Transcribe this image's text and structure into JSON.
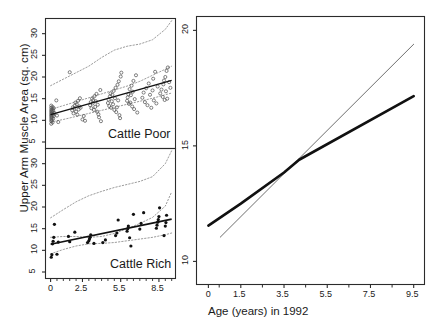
{
  "figure": {
    "ylabel": "Upper Arm Muscle Area (sq. cm)",
    "xlabel_right": "Age (years) in 1992"
  },
  "panels": {
    "top_left": {
      "tag": "Cattle Poor",
      "yticks": [
        "5",
        "10",
        "15",
        "20",
        "25",
        "30"
      ],
      "ytick_values": [
        5,
        10,
        15,
        20,
        25,
        30
      ],
      "xticks": [
        "0",
        "2.5",
        "5.5",
        "8.5"
      ],
      "xtick_values": [
        0,
        2.5,
        5.5,
        8.5
      ]
    },
    "bottom_left": {
      "tag": "Cattle Rich",
      "yticks": [
        "5",
        "10",
        "15",
        "20",
        "25",
        "30"
      ],
      "ytick_values": [
        5,
        10,
        15,
        20,
        25,
        30
      ],
      "xticks": [
        "0",
        "2.5",
        "5.5",
        "8.5"
      ],
      "xtick_values": [
        0,
        2.5,
        5.5,
        8.5
      ]
    },
    "right": {
      "yticks": [
        "10",
        "15",
        "20"
      ],
      "ytick_values": [
        10,
        15,
        20
      ],
      "xticks": [
        "0",
        "1.5",
        "3.5",
        "5.5",
        "7.5",
        "9.5"
      ],
      "xtick_values": [
        0,
        1.5,
        3.5,
        5.5,
        7.5,
        9.5
      ]
    }
  },
  "colors": {
    "axis": "#2b2b2b",
    "fit_line": "#111111",
    "band": "#8a8a8a",
    "point_open": "#555555",
    "point_filled": "#111111",
    "thin_line": "#6e6e6e",
    "thick_line": "#111111"
  },
  "chart_data": {
    "type": "scatter",
    "title": "",
    "ylabel": "Upper Arm Muscle Area (sq. cm)",
    "xlabel": "Age (years) in 1992",
    "panels": [
      {
        "name": "Cattle Poor",
        "position": "top-left",
        "marker": "open-circle",
        "xlim": [
          -0.4,
          9.8
        ],
        "ylim": [
          3.5,
          33.5
        ],
        "xticks": [
          0,
          2.5,
          5.5,
          8.5
        ],
        "yticks": [
          5,
          10,
          15,
          20,
          25,
          30
        ],
        "grid": false,
        "points": [
          [
            0.05,
            9.2
          ],
          [
            0.05,
            9.8
          ],
          [
            0.05,
            10.3
          ],
          [
            0.05,
            10.8
          ],
          [
            0.05,
            11.2
          ],
          [
            0.05,
            11.6
          ],
          [
            0.05,
            12.0
          ],
          [
            0.05,
            12.4
          ],
          [
            0.05,
            12.9
          ],
          [
            0.05,
            13.4
          ],
          [
            0.1,
            10.0
          ],
          [
            0.1,
            10.6
          ],
          [
            0.1,
            11.1
          ],
          [
            0.1,
            11.5
          ],
          [
            0.1,
            12.1
          ],
          [
            0.15,
            9.5
          ],
          [
            0.15,
            11.8
          ],
          [
            0.15,
            12.6
          ],
          [
            0.15,
            13.1
          ],
          [
            0.2,
            10.4
          ],
          [
            0.2,
            11.3
          ],
          [
            0.2,
            12.2
          ],
          [
            0.25,
            11.0
          ],
          [
            0.25,
            12.8
          ],
          [
            0.3,
            11.7
          ],
          [
            0.45,
            14.6
          ],
          [
            0.5,
            11.1
          ],
          [
            0.6,
            9.6
          ],
          [
            1.5,
            21.1
          ],
          [
            1.7,
            12.3
          ],
          [
            1.75,
            13.0
          ],
          [
            1.8,
            11.6
          ],
          [
            1.85,
            12.7
          ],
          [
            1.9,
            13.4
          ],
          [
            1.95,
            14.1
          ],
          [
            2.0,
            12.0
          ],
          [
            2.05,
            13.7
          ],
          [
            2.1,
            11.3
          ],
          [
            2.15,
            14.5
          ],
          [
            2.2,
            12.5
          ],
          [
            2.25,
            13.2
          ],
          [
            2.3,
            15.1
          ],
          [
            2.35,
            12.9
          ],
          [
            2.5,
            10.2
          ],
          [
            2.6,
            11.0
          ],
          [
            2.7,
            9.9
          ],
          [
            3.1,
            13.5
          ],
          [
            3.15,
            14.2
          ],
          [
            3.2,
            12.8
          ],
          [
            3.25,
            15.0
          ],
          [
            3.3,
            13.9
          ],
          [
            3.35,
            14.7
          ],
          [
            3.4,
            12.4
          ],
          [
            3.45,
            15.6
          ],
          [
            3.5,
            13.1
          ],
          [
            3.55,
            14.4
          ],
          [
            3.6,
            16.1
          ],
          [
            3.65,
            12.0
          ],
          [
            3.7,
            13.6
          ],
          [
            3.75,
            11.4
          ],
          [
            3.8,
            10.7
          ],
          [
            3.9,
            17.0
          ],
          [
            3.95,
            9.8
          ],
          [
            4.5,
            14.0
          ],
          [
            4.55,
            14.8
          ],
          [
            4.6,
            13.3
          ],
          [
            4.65,
            15.5
          ],
          [
            4.7,
            16.2
          ],
          [
            4.75,
            12.9
          ],
          [
            4.8,
            14.4
          ],
          [
            4.85,
            15.9
          ],
          [
            4.9,
            13.7
          ],
          [
            4.95,
            16.8
          ],
          [
            5.0,
            12.4
          ],
          [
            5.05,
            15.1
          ],
          [
            5.1,
            17.5
          ],
          [
            5.15,
            11.9
          ],
          [
            5.2,
            13.0
          ],
          [
            5.25,
            18.2
          ],
          [
            5.3,
            14.6
          ],
          [
            5.35,
            19.0
          ],
          [
            5.4,
            11.2
          ],
          [
            5.45,
            10.5
          ],
          [
            5.5,
            20.1
          ],
          [
            5.55,
            21.0
          ],
          [
            6.0,
            14.5
          ],
          [
            6.05,
            15.3
          ],
          [
            6.1,
            16.0
          ],
          [
            6.15,
            13.8
          ],
          [
            6.2,
            17.2
          ],
          [
            6.25,
            14.1
          ],
          [
            6.3,
            15.8
          ],
          [
            6.35,
            18.0
          ],
          [
            6.4,
            13.2
          ],
          [
            6.45,
            16.6
          ],
          [
            6.5,
            19.1
          ],
          [
            6.55,
            12.6
          ],
          [
            6.6,
            14.9
          ],
          [
            6.7,
            20.4
          ],
          [
            6.8,
            11.8
          ],
          [
            7.2,
            15.2
          ],
          [
            7.3,
            16.4
          ],
          [
            7.4,
            14.2
          ],
          [
            7.5,
            17.4
          ],
          [
            7.6,
            13.5
          ],
          [
            7.7,
            18.5
          ],
          [
            7.8,
            15.9
          ],
          [
            7.9,
            12.9
          ],
          [
            8.0,
            16.9
          ],
          [
            8.05,
            19.6
          ],
          [
            8.1,
            14.6
          ],
          [
            8.2,
            21.2
          ],
          [
            8.3,
            13.9
          ],
          [
            8.4,
            17.8
          ],
          [
            8.6,
            16.2
          ],
          [
            8.7,
            17.1
          ],
          [
            8.8,
            15.4
          ],
          [
            8.85,
            18.3
          ],
          [
            8.9,
            19.2
          ],
          [
            8.95,
            14.7
          ],
          [
            9.0,
            20.0
          ],
          [
            9.05,
            16.7
          ],
          [
            9.1,
            21.4
          ],
          [
            9.15,
            15.0
          ],
          [
            9.2,
            22.2
          ],
          [
            9.3,
            18.8
          ],
          [
            9.4,
            17.5
          ]
        ],
        "fit_line": {
          "x": [
            0.0,
            9.5
          ],
          "y": [
            11.3,
            19.2
          ]
        },
        "upper_band": {
          "x": [
            0,
            1,
            2,
            3,
            4,
            5,
            6,
            7,
            8,
            9,
            9.5
          ],
          "y": [
            12.5,
            13.4,
            14.3,
            15.2,
            16.1,
            17.0,
            17.9,
            19.0,
            20.4,
            21.8,
            22.5
          ]
        },
        "lower_band": {
          "x": [
            0,
            1,
            2,
            3,
            4,
            5,
            6,
            7,
            8,
            9,
            9.5
          ],
          "y": [
            9.6,
            10.2,
            10.9,
            11.6,
            12.3,
            13.0,
            13.7,
            14.4,
            15.1,
            15.9,
            16.3
          ]
        },
        "outer_band": {
          "x": [
            0,
            1,
            2,
            3,
            4,
            5,
            6,
            7,
            8,
            9,
            9.5
          ],
          "y": [
            18.0,
            19.5,
            21.0,
            22.5,
            24.5,
            26.2,
            27.1,
            27.6,
            28.6,
            31.0,
            33.0
          ]
        }
      },
      {
        "name": "Cattle Rich",
        "position": "bottom-left",
        "marker": "filled-circle",
        "xlim": [
          -0.4,
          9.8
        ],
        "ylim": [
          3.5,
          33.5
        ],
        "xticks": [
          0,
          2.5,
          5.5,
          8.5
        ],
        "yticks": [
          5,
          10,
          15,
          20,
          25,
          30
        ],
        "grid": false,
        "points": [
          [
            0.05,
            8.4
          ],
          [
            0.1,
            9.0
          ],
          [
            0.15,
            11.5
          ],
          [
            0.2,
            12.1
          ],
          [
            0.25,
            13.0
          ],
          [
            0.3,
            16.0
          ],
          [
            0.5,
            9.1
          ],
          [
            0.6,
            11.9
          ],
          [
            1.4,
            13.2
          ],
          [
            1.5,
            12.0
          ],
          [
            1.9,
            14.2
          ],
          [
            2.9,
            11.8
          ],
          [
            3.0,
            12.2
          ],
          [
            3.05,
            12.6
          ],
          [
            3.1,
            13.0
          ],
          [
            3.15,
            13.6
          ],
          [
            3.4,
            11.6
          ],
          [
            4.1,
            11.8
          ],
          [
            4.3,
            12.4
          ],
          [
            5.1,
            13.4
          ],
          [
            5.2,
            14.0
          ],
          [
            5.3,
            17.0
          ],
          [
            6.0,
            14.4
          ],
          [
            6.05,
            15.0
          ],
          [
            6.1,
            15.6
          ],
          [
            6.2,
            12.9
          ],
          [
            6.3,
            11.0
          ],
          [
            6.5,
            18.3
          ],
          [
            7.0,
            14.9
          ],
          [
            7.1,
            16.2
          ],
          [
            7.3,
            18.7
          ],
          [
            8.3,
            15.1
          ],
          [
            8.35,
            15.8
          ],
          [
            8.4,
            16.5
          ],
          [
            8.45,
            17.1
          ],
          [
            8.5,
            17.8
          ],
          [
            8.55,
            19.8
          ],
          [
            8.9,
            13.4
          ],
          [
            9.0,
            15.6
          ],
          [
            9.05,
            16.4
          ],
          [
            9.1,
            18.1
          ]
        ],
        "fit_line": {
          "x": [
            0.0,
            9.5
          ],
          "y": [
            11.4,
            17.2
          ]
        },
        "upper_band": {
          "x": [
            0,
            1,
            2,
            3,
            4,
            5,
            6,
            7,
            8,
            9,
            9.5
          ],
          "y": [
            13.0,
            13.2,
            13.2,
            13.0,
            13.2,
            13.9,
            15.0,
            16.2,
            17.6,
            20.2,
            23.5
          ]
        },
        "lower_band": {
          "x": [
            0,
            1,
            2,
            3,
            4,
            5,
            6,
            7,
            8,
            9,
            9.5
          ],
          "y": [
            9.2,
            10.2,
            11.0,
            11.5,
            11.6,
            11.8,
            12.2,
            12.6,
            13.0,
            13.6,
            14.0
          ]
        },
        "outer_band": {
          "x": [
            0,
            1,
            2,
            3,
            4,
            5,
            6,
            7,
            8,
            9,
            9.5
          ],
          "y": [
            17.5,
            19.4,
            21.2,
            22.6,
            23.6,
            24.5,
            25.2,
            25.9,
            27.0,
            30.0,
            33.0
          ]
        }
      },
      {
        "name": "Comparison",
        "position": "right",
        "xlim": [
          -0.55,
          10.0
        ],
        "ylim": [
          9.0,
          20.6
        ],
        "xticks": [
          0,
          1.5,
          3.5,
          5.5,
          7.5,
          9.5
        ],
        "yticks": [
          10,
          15,
          20
        ],
        "grid": false,
        "series": [
          {
            "name": "thin-line",
            "style": "thin",
            "x": [
              0.55,
              9.5
            ],
            "y": [
              11.05,
              19.4
            ]
          },
          {
            "name": "thick-line",
            "style": "thick",
            "x": [
              0.0,
              1.5,
              3.5,
              4.2,
              9.5
            ],
            "y": [
              11.55,
              12.5,
              13.85,
              14.4,
              17.15
            ]
          }
        ]
      }
    ]
  }
}
